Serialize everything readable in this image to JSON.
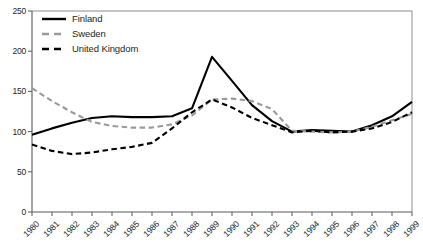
{
  "chart_data": {
    "type": "line",
    "title": "",
    "xlabel": "",
    "ylabel": "",
    "ylim": [
      0,
      250
    ],
    "yticks": [
      0,
      50,
      100,
      150,
      200,
      250
    ],
    "grid": false,
    "legend_position": "top-left",
    "categories": [
      "1980",
      "1981",
      "1982",
      "1983",
      "1984",
      "1985",
      "1986",
      "1987",
      "1988",
      "1989",
      "1990",
      "1991",
      "1992",
      "1993",
      "1994",
      "1995",
      "1996",
      "1997",
      "1998",
      "1999"
    ],
    "series": [
      {
        "name": "Finland",
        "style": "solid",
        "color": "#000000",
        "values": [
          96,
          104,
          111,
          117,
          119,
          118,
          118,
          119,
          129,
          193,
          163,
          133,
          113,
          100,
          102,
          101,
          100,
          108,
          119,
          137
        ]
      },
      {
        "name": "Sweden",
        "style": "dashed",
        "color": "#9a9a9a",
        "values": [
          154,
          138,
          124,
          112,
          107,
          105,
          105,
          109,
          120,
          140,
          141,
          138,
          128,
          101,
          100,
          99,
          100,
          106,
          114,
          122
        ]
      },
      {
        "name": "United Kingdom",
        "style": "dashed",
        "color": "#000000",
        "values": [
          84,
          76,
          72,
          74,
          78,
          81,
          86,
          104,
          124,
          140,
          130,
          117,
          108,
          99,
          101,
          99,
          100,
          104,
          112,
          124
        ]
      }
    ]
  },
  "legend": {
    "items": [
      {
        "label": "Finland"
      },
      {
        "label": "Sweden"
      },
      {
        "label": "United Kingdom"
      }
    ]
  },
  "axes": {
    "y_tick_labels": [
      "250",
      "200",
      "150",
      "100",
      "50",
      "0"
    ],
    "x_tick_labels": [
      "1980",
      "1981",
      "1982",
      "1983",
      "1984",
      "1985",
      "1986",
      "1987",
      "1988",
      "1989",
      "1990",
      "1991",
      "1992",
      "1993",
      "1994",
      "1995",
      "1996",
      "1997",
      "1998",
      "1999"
    ]
  }
}
